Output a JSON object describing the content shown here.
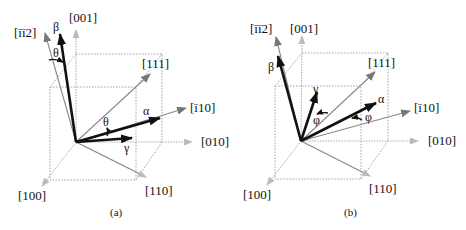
{
  "figure": {
    "panels": [
      {
        "id": "a",
        "caption": "(a)",
        "axes": {
          "z": "[001]",
          "y": "[010]",
          "x": "[100]",
          "d110": "[110]",
          "d111": "[111]",
          "dm110": "[ī10]",
          "dm1m12": "[īī2]"
        },
        "vectors": [
          "α",
          "β",
          "γ"
        ],
        "angle_label": "θ"
      },
      {
        "id": "b",
        "caption": "(b)",
        "axes": {
          "z": "[001]",
          "y": "[010]",
          "x": "[100]",
          "d110": "[110]",
          "d111": "[111]",
          "dm110": "[ī10]",
          "dm1m12": "[īī2]"
        },
        "vectors": [
          "α",
          "β",
          "γ"
        ],
        "angle_label": "φ"
      }
    ],
    "colors": {
      "crystal_axes": "#aaaaaa",
      "reference_directions": "#888888",
      "vectors": "#111111"
    }
  }
}
